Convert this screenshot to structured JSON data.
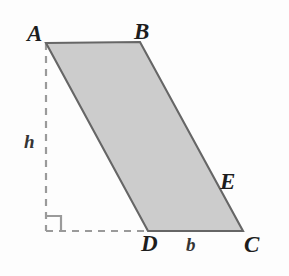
{
  "figure": {
    "name": "parallelogram-with-height",
    "shape_type": "parallelogram",
    "fill_color": "#cccccc",
    "stroke_color": "#666666",
    "dash_color": "#9a9a9a",
    "background_color": "#fdfdfd",
    "vertices": [
      {
        "label": "A",
        "x": 46,
        "y": 43
      },
      {
        "label": "B",
        "x": 140,
        "y": 42
      },
      {
        "label": "C",
        "x": 243,
        "y": 231
      },
      {
        "label": "D",
        "x": 148,
        "y": 231
      }
    ],
    "point_on_edge": {
      "label": "E",
      "x": 215,
      "y": 192
    },
    "dimension_labels": {
      "height": "h",
      "base": "b"
    },
    "vertex_labels": {
      "a": "A",
      "b": "B",
      "c": "C",
      "d": "D",
      "e": "E"
    },
    "dashed_height_line": {
      "x": 46,
      "y1": 43,
      "y2": 231
    },
    "dashed_base_extension": {
      "y": 231,
      "x1": 46,
      "x2": 148
    },
    "right_angle_marker": {
      "x": 46,
      "y": 231,
      "size": 15
    }
  }
}
